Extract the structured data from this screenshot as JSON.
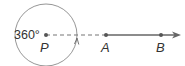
{
  "diagram": {
    "angle_label": "360°",
    "points": {
      "P": "P",
      "A": "A",
      "B": "B"
    },
    "colors": {
      "stroke": "#666666",
      "point": "#555555",
      "text": "#333333"
    }
  }
}
